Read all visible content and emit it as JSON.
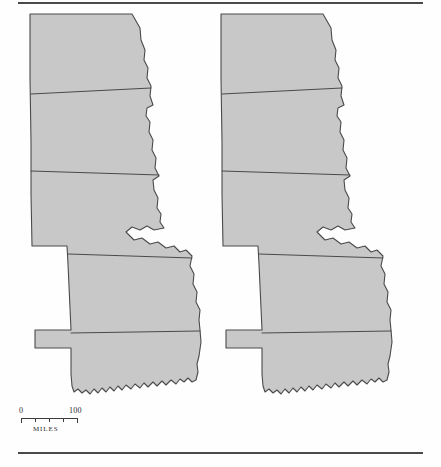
{
  "figure": {
    "type": "map-pair",
    "region": "Great Plains",
    "background_color": "#fefefe",
    "land_fill_color": "#c8c8c8",
    "boundary_color": "#4a4a4a",
    "rule_color": "#4a4a4a"
  },
  "rules": {
    "top_label": "top-page-rule",
    "bottom_label": "bottom-page-rule"
  },
  "maps": [
    {
      "id": "map-left",
      "name": "left-map",
      "states": [
        "North Dakota",
        "South Dakota",
        "Nebraska",
        "Kansas",
        "Oklahoma"
      ]
    },
    {
      "id": "map-right",
      "name": "right-map",
      "states": [
        "North Dakota",
        "South Dakota",
        "Nebraska",
        "Kansas",
        "Oklahoma"
      ]
    }
  ],
  "scale": {
    "min_label": "0",
    "max_label": "100",
    "units_label": "MILES",
    "tick_count": 5
  }
}
